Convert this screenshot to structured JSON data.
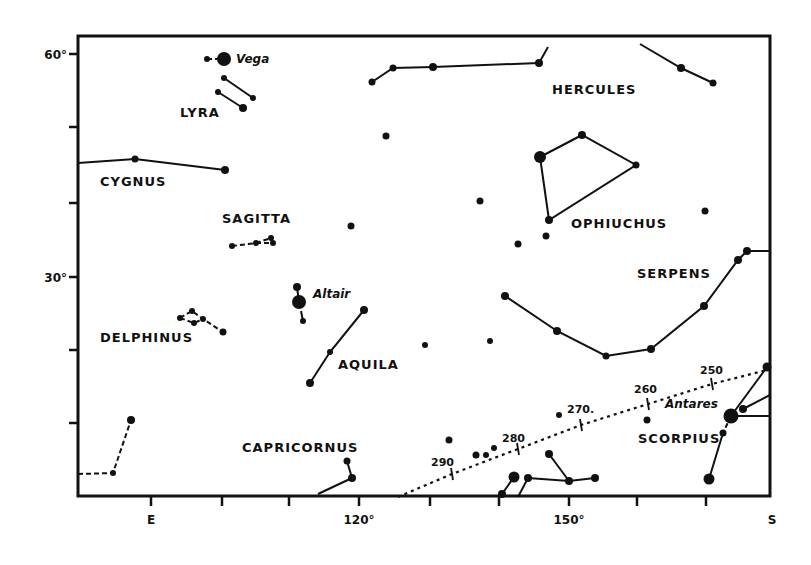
{
  "chart": {
    "frame": {
      "left": 78,
      "top": 36,
      "right": 770,
      "bottom": 496
    },
    "y_axis": {
      "ticks": [
        {
          "y": 54,
          "label": "60°"
        },
        {
          "y": 127,
          "label": ""
        },
        {
          "y": 203,
          "label": ""
        },
        {
          "y": 277,
          "label": "30°"
        },
        {
          "y": 350,
          "label": ""
        },
        {
          "y": 423,
          "label": ""
        }
      ]
    },
    "x_axis": {
      "ticks": [
        {
          "x": 151,
          "label": "E"
        },
        {
          "x": 222,
          "label": ""
        },
        {
          "x": 289,
          "label": ""
        },
        {
          "x": 359,
          "label": "120°"
        },
        {
          "x": 430,
          "label": ""
        },
        {
          "x": 499,
          "label": ""
        },
        {
          "x": 569,
          "label": "150°"
        },
        {
          "x": 637,
          "label": ""
        },
        {
          "x": 706,
          "label": ""
        },
        {
          "x": 772,
          "label": "S"
        }
      ]
    },
    "constellation_labels": [
      {
        "text": "LYRA",
        "x": 180,
        "y": 117
      },
      {
        "text": "HERCULES",
        "x": 552,
        "y": 94
      },
      {
        "text": "CYGNUS",
        "x": 100,
        "y": 186
      },
      {
        "text": "SAGITTA",
        "x": 222,
        "y": 223
      },
      {
        "text": "OPHIUCHUS",
        "x": 571,
        "y": 228
      },
      {
        "text": "SERPENS",
        "x": 637,
        "y": 278
      },
      {
        "text": "DELPHINUS",
        "x": 100,
        "y": 342
      },
      {
        "text": "AQUILA",
        "x": 338,
        "y": 369
      },
      {
        "text": "SCORPIUS",
        "x": 638,
        "y": 443
      },
      {
        "text": "CAPRICORNUS",
        "x": 242,
        "y": 452
      }
    ],
    "star_labels": [
      {
        "text": "Vega",
        "x": 236,
        "y": 63
      },
      {
        "text": "Altair",
        "x": 313,
        "y": 298
      },
      {
        "text": "Antares",
        "x": 665,
        "y": 408
      }
    ],
    "ecliptic_labels": [
      {
        "text": "250",
        "x": 700,
        "y": 374
      },
      {
        "text": "260",
        "x": 634,
        "y": 393
      },
      {
        "text": "270.",
        "x": 567,
        "y": 413
      },
      {
        "text": "280",
        "x": 502,
        "y": 442
      },
      {
        "text": "290",
        "x": 431,
        "y": 466
      }
    ],
    "stars": [
      {
        "x": 207,
        "y": 59,
        "r": 3
      },
      {
        "x": 224,
        "y": 59,
        "r": 7
      },
      {
        "x": 224,
        "y": 78,
        "r": 3
      },
      {
        "x": 218,
        "y": 92,
        "r": 3
      },
      {
        "x": 253,
        "y": 98,
        "r": 3
      },
      {
        "x": 243,
        "y": 108,
        "r": 4
      },
      {
        "x": 372,
        "y": 82,
        "r": 3.5
      },
      {
        "x": 393,
        "y": 68,
        "r": 3.5
      },
      {
        "x": 433,
        "y": 67,
        "r": 4
      },
      {
        "x": 539,
        "y": 63,
        "r": 4
      },
      {
        "x": 681,
        "y": 68,
        "r": 4
      },
      {
        "x": 713,
        "y": 83,
        "r": 3.5
      },
      {
        "x": 386,
        "y": 136,
        "r": 3.5
      },
      {
        "x": 135,
        "y": 159,
        "r": 3.5
      },
      {
        "x": 225,
        "y": 170,
        "r": 4
      },
      {
        "x": 540,
        "y": 157,
        "r": 6
      },
      {
        "x": 582,
        "y": 135,
        "r": 4
      },
      {
        "x": 636,
        "y": 165,
        "r": 3.5
      },
      {
        "x": 549,
        "y": 220,
        "r": 4
      },
      {
        "x": 546,
        "y": 236,
        "r": 3.5
      },
      {
        "x": 518,
        "y": 244,
        "r": 3.5
      },
      {
        "x": 480,
        "y": 201,
        "r": 3.5
      },
      {
        "x": 705,
        "y": 211,
        "r": 3.5
      },
      {
        "x": 351,
        "y": 226,
        "r": 3.5
      },
      {
        "x": 232,
        "y": 246,
        "r": 3
      },
      {
        "x": 256,
        "y": 243,
        "r": 3
      },
      {
        "x": 271,
        "y": 238,
        "r": 3
      },
      {
        "x": 273,
        "y": 243,
        "r": 3
      },
      {
        "x": 297,
        "y": 287,
        "r": 4
      },
      {
        "x": 299,
        "y": 302,
        "r": 7
      },
      {
        "x": 303,
        "y": 321,
        "r": 3
      },
      {
        "x": 364,
        "y": 310,
        "r": 4
      },
      {
        "x": 330,
        "y": 352,
        "r": 3
      },
      {
        "x": 310,
        "y": 383,
        "r": 4
      },
      {
        "x": 425,
        "y": 345,
        "r": 3
      },
      {
        "x": 490,
        "y": 341,
        "r": 3
      },
      {
        "x": 505,
        "y": 296,
        "r": 4
      },
      {
        "x": 557,
        "y": 331,
        "r": 4
      },
      {
        "x": 606,
        "y": 356,
        "r": 3.5
      },
      {
        "x": 651,
        "y": 349,
        "r": 4
      },
      {
        "x": 704,
        "y": 306,
        "r": 4
      },
      {
        "x": 738,
        "y": 260,
        "r": 4
      },
      {
        "x": 747,
        "y": 251,
        "r": 4
      },
      {
        "x": 180,
        "y": 318,
        "r": 3
      },
      {
        "x": 192,
        "y": 311,
        "r": 3
      },
      {
        "x": 194,
        "y": 323,
        "r": 3
      },
      {
        "x": 203,
        "y": 319,
        "r": 3
      },
      {
        "x": 223,
        "y": 332,
        "r": 3.5
      },
      {
        "x": 131,
        "y": 420,
        "r": 4
      },
      {
        "x": 113,
        "y": 473,
        "r": 3
      },
      {
        "x": 347,
        "y": 461,
        "r": 3.5
      },
      {
        "x": 352,
        "y": 478,
        "r": 4
      },
      {
        "x": 449,
        "y": 440,
        "r": 3.5
      },
      {
        "x": 476,
        "y": 455,
        "r": 3.5
      },
      {
        "x": 486,
        "y": 455,
        "r": 3
      },
      {
        "x": 494,
        "y": 448,
        "r": 3
      },
      {
        "x": 559,
        "y": 415,
        "r": 3
      },
      {
        "x": 549,
        "y": 454,
        "r": 4
      },
      {
        "x": 514,
        "y": 477,
        "r": 5.5
      },
      {
        "x": 528,
        "y": 478,
        "r": 4
      },
      {
        "x": 569,
        "y": 481,
        "r": 4
      },
      {
        "x": 595,
        "y": 478,
        "r": 4
      },
      {
        "x": 502,
        "y": 494,
        "r": 4
      },
      {
        "x": 647,
        "y": 420,
        "r": 3.5
      },
      {
        "x": 731,
        "y": 416,
        "r": 7.5
      },
      {
        "x": 743,
        "y": 409,
        "r": 4
      },
      {
        "x": 767,
        "y": 367,
        "r": 4.5
      },
      {
        "x": 723,
        "y": 433,
        "r": 3.5
      },
      {
        "x": 709,
        "y": 479,
        "r": 5.5
      }
    ],
    "solid_lines": [
      [
        [
          218,
          92
        ],
        [
          243,
          108
        ]
      ],
      [
        [
          224,
          78
        ],
        [
          253,
          98
        ]
      ],
      [
        [
          372,
          82
        ],
        [
          393,
          68
        ],
        [
          433,
          67
        ],
        [
          539,
          63
        ]
      ],
      [
        [
          539,
          63
        ],
        [
          548,
          47
        ]
      ],
      [
        [
          640,
          44
        ],
        [
          681,
          68
        ],
        [
          713,
          83
        ]
      ],
      [
        [
          78,
          163
        ],
        [
          135,
          159
        ],
        [
          225,
          170
        ]
      ],
      [
        [
          540,
          157
        ],
        [
          582,
          135
        ],
        [
          636,
          165
        ],
        [
          549,
          220
        ],
        [
          540,
          157
        ]
      ],
      [
        [
          297,
          287
        ],
        [
          299,
          302
        ]
      ],
      [
        [
          301,
          311
        ],
        [
          303,
          321
        ]
      ],
      [
        [
          364,
          310
        ],
        [
          330,
          352
        ],
        [
          310,
          383
        ]
      ],
      [
        [
          505,
          296
        ],
        [
          557,
          331
        ],
        [
          606,
          356
        ],
        [
          651,
          349
        ],
        [
          704,
          306
        ],
        [
          738,
          260
        ],
        [
          747,
          251
        ],
        [
          770,
          251
        ]
      ],
      [
        [
          318,
          494
        ],
        [
          352,
          478
        ]
      ],
      [
        [
          347,
          461
        ],
        [
          352,
          478
        ]
      ],
      [
        [
          514,
          477
        ],
        [
          502,
          494
        ]
      ],
      [
        [
          528,
          478
        ],
        [
          518,
          497
        ]
      ],
      [
        [
          528,
          478
        ],
        [
          569,
          481
        ],
        [
          595,
          478
        ]
      ],
      [
        [
          549,
          454
        ],
        [
          569,
          481
        ]
      ],
      [
        [
          731,
          416
        ],
        [
          767,
          367
        ]
      ],
      [
        [
          743,
          409
        ],
        [
          770,
          395
        ]
      ],
      [
        [
          731,
          416
        ],
        [
          770,
          416
        ]
      ],
      [
        [
          723,
          433
        ],
        [
          709,
          479
        ]
      ]
    ],
    "dashed_lines": [
      [
        [
          207,
          59
        ],
        [
          218,
          59
        ]
      ],
      [
        [
          232,
          246
        ],
        [
          256,
          243
        ],
        [
          271,
          238
        ]
      ],
      [
        [
          256,
          243
        ],
        [
          273,
          243
        ]
      ],
      [
        [
          180,
          318
        ],
        [
          192,
          311
        ],
        [
          203,
          319
        ],
        [
          223,
          332
        ]
      ],
      [
        [
          180,
          318
        ],
        [
          194,
          323
        ],
        [
          203,
          319
        ]
      ],
      [
        [
          78,
          474
        ],
        [
          113,
          473
        ],
        [
          131,
          420
        ]
      ],
      [
        [
          731,
          416
        ],
        [
          723,
          433
        ]
      ]
    ],
    "ecliptic": [
      [
        398,
        497
      ],
      [
        452,
        474
      ],
      [
        518,
        449
      ],
      [
        581,
        425
      ],
      [
        648,
        404
      ],
      [
        712,
        384
      ],
      [
        767,
        370
      ]
    ],
    "ecliptic_ticks": [
      [
        452,
        474
      ],
      [
        518,
        449
      ],
      [
        581,
        425
      ],
      [
        648,
        404
      ],
      [
        712,
        384
      ]
    ]
  }
}
